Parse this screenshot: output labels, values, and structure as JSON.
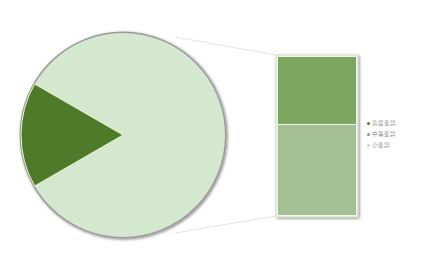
{
  "chart_data": {
    "type": "pie",
    "subtype": "bar-of-pie",
    "title": "",
    "pie": {
      "slices": [
        {
          "name": "高度变异+中等变异 (detail)",
          "value": 16.7,
          "color": "#4f7a2a"
        },
        {
          "name": "小变异",
          "value": 83.3,
          "color": "#d4e8cf"
        }
      ],
      "start_angle_deg": 150,
      "end_angle_deg": 210
    },
    "bar": {
      "segments": [
        {
          "name": "高度变异",
          "value": 43,
          "color": "#7ba65e"
        },
        {
          "name": "中等变异",
          "value": 57,
          "color": "#a3c095"
        }
      ]
    },
    "legend": {
      "position": "right",
      "entries": [
        {
          "label": "高度变异",
          "color": "#4f7a2a"
        },
        {
          "label": "中等变异",
          "color": "#7ba65e"
        },
        {
          "label": "小变异",
          "color": "#c5dcbf"
        }
      ]
    },
    "xlabel": "",
    "ylabel": "",
    "grid": false
  }
}
